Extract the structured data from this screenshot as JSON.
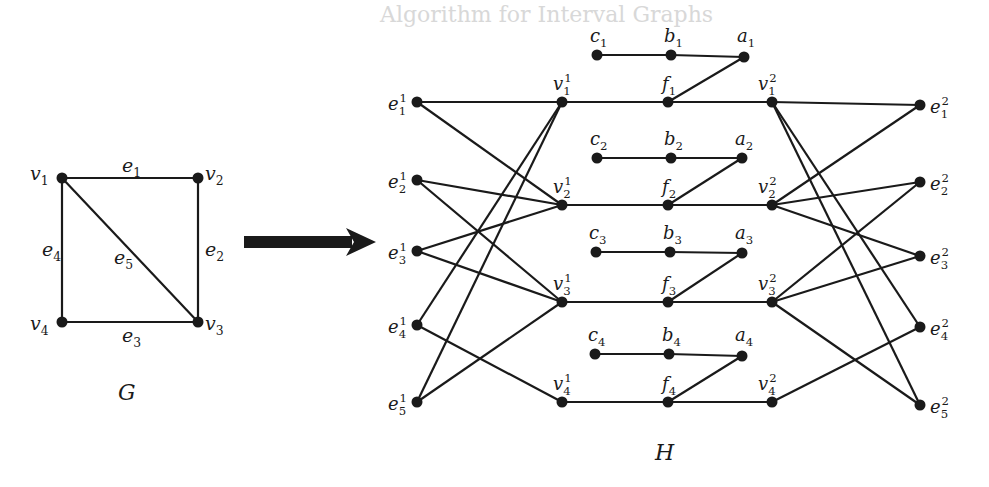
{
  "background_text": {
    "heading": "Algorithm for Interval Graphs",
    "lines": [
      "In this section, we present a polynomial-time algorithm to compute a minimum",
      "cardinality ... for interval graphs.",
      "Many algorithms for problems on interval graphs exist, and they are",
      "...",
      "Lemma 4.1 ..."
    ]
  },
  "graph_G": {
    "label": "G",
    "vertices": [
      {
        "id": "v1",
        "label": "v",
        "sub": "1",
        "x": 62,
        "y": 178,
        "lx": 30,
        "ly": 180
      },
      {
        "id": "v2",
        "label": "v",
        "sub": "2",
        "x": 198,
        "y": 178,
        "lx": 205,
        "ly": 180
      },
      {
        "id": "v3",
        "label": "v",
        "sub": "3",
        "x": 198,
        "y": 322,
        "lx": 205,
        "ly": 330
      },
      {
        "id": "v4",
        "label": "v",
        "sub": "4",
        "x": 62,
        "y": 322,
        "lx": 30,
        "ly": 330
      }
    ],
    "edges": [
      {
        "from": "v1",
        "to": "v2",
        "label": "e",
        "sub": "1",
        "lx": 122,
        "ly": 172
      },
      {
        "from": "v2",
        "to": "v3",
        "label": "e",
        "sub": "2",
        "lx": 205,
        "ly": 256
      },
      {
        "from": "v4",
        "to": "v3",
        "label": "e",
        "sub": "3",
        "lx": 122,
        "ly": 342
      },
      {
        "from": "v1",
        "to": "v4",
        "label": "e",
        "sub": "4",
        "lx": 42,
        "ly": 256
      },
      {
        "from": "v1",
        "to": "v3",
        "label": "e",
        "sub": "5",
        "lx": 114,
        "ly": 264
      }
    ],
    "caption_pos": {
      "x": 118,
      "y": 400
    }
  },
  "arrow": {
    "x1": 244,
    "y1": 242,
    "x2": 376,
    "y2": 242
  },
  "graph_H": {
    "label": "H",
    "caption_pos": {
      "x": 655,
      "y": 460
    },
    "vertices": [
      {
        "id": "e11",
        "label": "e",
        "sub": "1",
        "sup": "1",
        "x": 417,
        "y": 102,
        "lx": 388,
        "ly": 110
      },
      {
        "id": "e12",
        "label": "e",
        "sub": "2",
        "sup": "1",
        "x": 417,
        "y": 180,
        "lx": 388,
        "ly": 188
      },
      {
        "id": "e13",
        "label": "e",
        "sub": "3",
        "sup": "1",
        "x": 417,
        "y": 251,
        "lx": 388,
        "ly": 259
      },
      {
        "id": "e14",
        "label": "e",
        "sub": "4",
        "sup": "1",
        "x": 417,
        "y": 325,
        "lx": 388,
        "ly": 333
      },
      {
        "id": "e15",
        "label": "e",
        "sub": "5",
        "sup": "1",
        "x": 417,
        "y": 402,
        "lx": 388,
        "ly": 410
      },
      {
        "id": "v11",
        "label": "v",
        "sub": "1",
        "sup": "1",
        "x": 562,
        "y": 102,
        "lx": 553,
        "ly": 90
      },
      {
        "id": "v21",
        "label": "v",
        "sub": "2",
        "sup": "1",
        "x": 562,
        "y": 205,
        "lx": 553,
        "ly": 193
      },
      {
        "id": "v31",
        "label": "v",
        "sub": "3",
        "sup": "1",
        "x": 562,
        "y": 302,
        "lx": 553,
        "ly": 290
      },
      {
        "id": "v41",
        "label": "v",
        "sub": "4",
        "sup": "1",
        "x": 562,
        "y": 402,
        "lx": 553,
        "ly": 390
      },
      {
        "id": "f1",
        "label": "f",
        "sub": "1",
        "x": 668,
        "y": 102,
        "lx": 662,
        "ly": 90
      },
      {
        "id": "f2",
        "label": "f",
        "sub": "2",
        "x": 668,
        "y": 205,
        "lx": 662,
        "ly": 193
      },
      {
        "id": "f3",
        "label": "f",
        "sub": "3",
        "x": 668,
        "y": 302,
        "lx": 662,
        "ly": 290
      },
      {
        "id": "f4",
        "label": "f",
        "sub": "4",
        "x": 668,
        "y": 402,
        "lx": 662,
        "ly": 390
      },
      {
        "id": "v12",
        "label": "v",
        "sub": "1",
        "sup": "2",
        "x": 772,
        "y": 102,
        "lx": 758,
        "ly": 90
      },
      {
        "id": "v22",
        "label": "v",
        "sub": "2",
        "sup": "2",
        "x": 772,
        "y": 205,
        "lx": 758,
        "ly": 193
      },
      {
        "id": "v32",
        "label": "v",
        "sub": "3",
        "sup": "2",
        "x": 772,
        "y": 302,
        "lx": 758,
        "ly": 290
      },
      {
        "id": "v42",
        "label": "v",
        "sub": "4",
        "sup": "2",
        "x": 772,
        "y": 402,
        "lx": 758,
        "ly": 390
      },
      {
        "id": "e21",
        "label": "e",
        "sub": "1",
        "sup": "2",
        "x": 920,
        "y": 105,
        "lx": 930,
        "ly": 113
      },
      {
        "id": "e22",
        "label": "e",
        "sub": "2",
        "sup": "2",
        "x": 920,
        "y": 182,
        "lx": 930,
        "ly": 190
      },
      {
        "id": "e23",
        "label": "e",
        "sub": "3",
        "sup": "2",
        "x": 920,
        "y": 256,
        "lx": 930,
        "ly": 264
      },
      {
        "id": "e24",
        "label": "e",
        "sub": "4",
        "sup": "2",
        "x": 920,
        "y": 327,
        "lx": 930,
        "ly": 335
      },
      {
        "id": "e25",
        "label": "e",
        "sub": "5",
        "sup": "2",
        "x": 920,
        "y": 405,
        "lx": 930,
        "ly": 413
      },
      {
        "id": "c1",
        "label": "c",
        "sub": "1",
        "x": 597,
        "y": 55,
        "lx": 590,
        "ly": 42
      },
      {
        "id": "b1",
        "label": "b",
        "sub": "1",
        "x": 671,
        "y": 55,
        "lx": 664,
        "ly": 42
      },
      {
        "id": "a1",
        "label": "a",
        "sub": "1",
        "x": 744,
        "y": 57,
        "lx": 737,
        "ly": 42
      },
      {
        "id": "c2",
        "label": "c",
        "sub": "2",
        "x": 597,
        "y": 158,
        "lx": 590,
        "ly": 145
      },
      {
        "id": "b2",
        "label": "b",
        "sub": "2",
        "x": 671,
        "y": 158,
        "lx": 664,
        "ly": 145
      },
      {
        "id": "a2",
        "label": "a",
        "sub": "2",
        "x": 742,
        "y": 158,
        "lx": 735,
        "ly": 145
      },
      {
        "id": "c3",
        "label": "c",
        "sub": "3",
        "x": 596,
        "y": 252,
        "lx": 589,
        "ly": 239
      },
      {
        "id": "b3",
        "label": "b",
        "sub": "3",
        "x": 670,
        "y": 252,
        "lx": 663,
        "ly": 239
      },
      {
        "id": "a3",
        "label": "a",
        "sub": "3",
        "x": 742,
        "y": 253,
        "lx": 735,
        "ly": 239
      },
      {
        "id": "c4",
        "label": "c",
        "sub": "4",
        "x": 595,
        "y": 354,
        "lx": 588,
        "ly": 341
      },
      {
        "id": "b4",
        "label": "b",
        "sub": "4",
        "x": 669,
        "y": 354,
        "lx": 662,
        "ly": 341
      },
      {
        "id": "a4",
        "label": "a",
        "sub": "4",
        "x": 742,
        "y": 356,
        "lx": 735,
        "ly": 341
      }
    ],
    "edges": [
      [
        "e11",
        "v11"
      ],
      [
        "e11",
        "v21"
      ],
      [
        "e12",
        "v21"
      ],
      [
        "e12",
        "v31"
      ],
      [
        "e13",
        "v21"
      ],
      [
        "e13",
        "v31"
      ],
      [
        "e14",
        "v11"
      ],
      [
        "e14",
        "v41"
      ],
      [
        "e15",
        "v11"
      ],
      [
        "e15",
        "v31"
      ],
      [
        "v11",
        "f1"
      ],
      [
        "f1",
        "v12"
      ],
      [
        "f1",
        "a1"
      ],
      [
        "c1",
        "b1"
      ],
      [
        "b1",
        "a1"
      ],
      [
        "v21",
        "f2"
      ],
      [
        "f2",
        "v22"
      ],
      [
        "f2",
        "a2"
      ],
      [
        "c2",
        "b2"
      ],
      [
        "b2",
        "a2"
      ],
      [
        "v31",
        "f3"
      ],
      [
        "f3",
        "v32"
      ],
      [
        "f3",
        "a3"
      ],
      [
        "c3",
        "b3"
      ],
      [
        "b3",
        "a3"
      ],
      [
        "v41",
        "f4"
      ],
      [
        "f4",
        "v42"
      ],
      [
        "f4",
        "a4"
      ],
      [
        "c4",
        "b4"
      ],
      [
        "b4",
        "a4"
      ],
      [
        "v12",
        "e21"
      ],
      [
        "v22",
        "e21"
      ],
      [
        "v22",
        "e22"
      ],
      [
        "v32",
        "e22"
      ],
      [
        "v22",
        "e23"
      ],
      [
        "v32",
        "e23"
      ],
      [
        "v12",
        "e24"
      ],
      [
        "v42",
        "e24"
      ],
      [
        "v12",
        "e25"
      ],
      [
        "v32",
        "e25"
      ]
    ]
  }
}
